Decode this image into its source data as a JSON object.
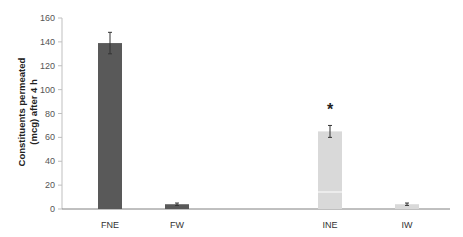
{
  "chart_data": {
    "type": "bar",
    "title": "",
    "xlabel": "",
    "ylabel": "Constituents permeated (mcg) after 4 h",
    "ylabel_lines": [
      "Constituents permeated",
      "(mcg) after 4 h"
    ],
    "categories": [
      "FNE",
      "FW",
      "INE",
      "IW"
    ],
    "values": [
      139,
      4,
      65,
      4
    ],
    "errors": [
      9,
      1,
      5,
      1
    ],
    "colors": [
      "#595959",
      "#595959",
      "#d9d9d9",
      "#d9d9d9"
    ],
    "annotations": [
      {
        "category": "INE",
        "text": "*"
      }
    ],
    "ylim": [
      0,
      160
    ],
    "yticks": [
      0,
      20,
      40,
      60,
      80,
      100,
      120,
      140,
      160
    ],
    "grid": false,
    "legend": null
  }
}
